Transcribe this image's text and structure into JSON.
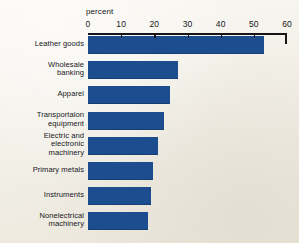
{
  "chart_data": {
    "type": "bar",
    "orientation": "horizontal",
    "title": "",
    "subtitle": "",
    "xlabel": "percent",
    "ylabel": "",
    "xlim": [
      0,
      60
    ],
    "xticks": [
      0,
      10,
      20,
      30,
      40,
      50,
      60
    ],
    "xtick_labels": [
      "0",
      "10",
      "20",
      "30",
      "40",
      "50",
      "60"
    ],
    "grid": false,
    "legend": null,
    "bar_color": "#1c4d8f",
    "background_color": "#f4f2ec",
    "axis_color": "#16161a",
    "categories": [
      "Leather goods",
      "Wholesale\nbanking",
      "Apparel",
      "Transportaion\nequipment",
      "Electric and\nelectronic\nmachinery",
      "Primary metals",
      "Instruments",
      "Nonelectrical\nmachinery"
    ],
    "values": [
      53,
      27,
      24.7,
      23,
      21,
      19.6,
      19,
      18
    ],
    "value_labels": [
      "53",
      "27",
      "24.7",
      "23",
      "21",
      "19.6",
      "19",
      "18"
    ]
  }
}
